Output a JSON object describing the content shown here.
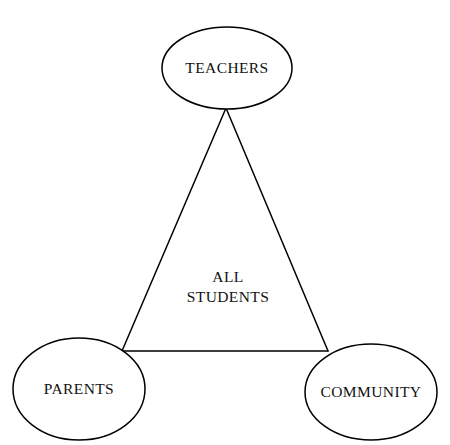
{
  "diagram": {
    "type": "triangle-relationship-diagram",
    "background_color": "#ffffff",
    "stroke_color": "#000000",
    "text_color": "#111111",
    "stroke_width": 1.5,
    "canvas": {
      "width": 450,
      "height": 445
    },
    "center": {
      "name": "all-students",
      "line1": "ALL",
      "line2": "STUDENTS",
      "x": 228,
      "y": 282,
      "line_height": 20
    },
    "nodes": [
      {
        "id": "teachers",
        "label": "TEACHERS",
        "cx": 227,
        "cy": 68,
        "rx": 65,
        "ry": 41
      },
      {
        "id": "parents",
        "label": "PARENTS",
        "cx": 79,
        "cy": 389,
        "rx": 66,
        "ry": 51
      },
      {
        "id": "community",
        "label": "COMMUNITY",
        "cx": 371,
        "cy": 392,
        "rx": 66,
        "ry": 48
      }
    ],
    "vertices": {
      "apex": {
        "x": 226,
        "y": 108
      },
      "left": {
        "x": 122,
        "y": 351
      },
      "right": {
        "x": 328,
        "y": 351
      }
    },
    "edges": [
      {
        "id": "teachers-to-parents",
        "from": "teachers",
        "to": "parents"
      },
      {
        "id": "teachers-to-community",
        "from": "teachers",
        "to": "community"
      },
      {
        "id": "parents-to-community",
        "from": "parents",
        "to": "community"
      }
    ]
  }
}
